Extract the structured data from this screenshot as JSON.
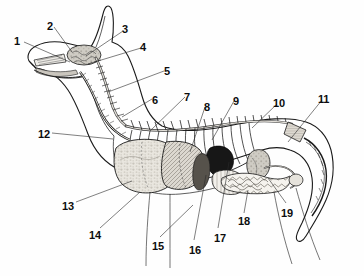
{
  "figure": {
    "view": "lateral (side) cutaway",
    "style": "pen-and-ink engraving, grayscale halftone",
    "background_color": "#fefefe",
    "ink_color": "#1a1a1a",
    "label_color": "#0d0d0d",
    "label_count": 19
  },
  "labels": [
    {
      "id": "1",
      "text": "1",
      "x": 14,
      "y": 36,
      "leader": [
        [
          24,
          42
        ],
        [
          70,
          62
        ]
      ]
    },
    {
      "id": "2",
      "text": "2",
      "x": 47,
      "y": 21,
      "leader": [
        [
          54,
          27
        ],
        [
          72,
          52
        ]
      ]
    },
    {
      "id": "3",
      "text": "3",
      "x": 122,
      "y": 24,
      "leader": [
        [
          123,
          31
        ],
        [
          86,
          56
        ]
      ]
    },
    {
      "id": "4",
      "text": "4",
      "x": 140,
      "y": 42,
      "leader": [
        [
          141,
          48
        ],
        [
          88,
          64
        ]
      ]
    },
    {
      "id": "5",
      "text": "5",
      "x": 164,
      "y": 66,
      "leader": [
        [
          164,
          71
        ],
        [
          108,
          92
        ]
      ]
    },
    {
      "id": "6",
      "text": "6",
      "x": 152,
      "y": 95,
      "leader": [
        [
          152,
          99
        ],
        [
          122,
          117
        ]
      ]
    },
    {
      "id": "7",
      "text": "7",
      "x": 184,
      "y": 92,
      "leader": [
        [
          185,
          97
        ],
        [
          150,
          131
        ]
      ]
    },
    {
      "id": "8",
      "text": "8",
      "x": 204,
      "y": 102,
      "leader": [
        [
          205,
          107
        ],
        [
          190,
          152
        ]
      ]
    },
    {
      "id": "9",
      "text": "9",
      "x": 233,
      "y": 96,
      "leader": [
        [
          234,
          101
        ],
        [
          212,
          140
        ]
      ]
    },
    {
      "id": "10",
      "text": "10",
      "x": 273,
      "y": 98,
      "leader": [
        [
          277,
          104
        ],
        [
          252,
          128
        ]
      ]
    },
    {
      "id": "11",
      "text": "11",
      "x": 318,
      "y": 94,
      "leader": [
        [
          322,
          100
        ],
        [
          288,
          142
        ]
      ]
    },
    {
      "id": "12",
      "text": "12",
      "x": 38,
      "y": 129,
      "leader": [
        [
          52,
          133
        ],
        [
          113,
          139
        ]
      ]
    },
    {
      "id": "13",
      "text": "13",
      "x": 62,
      "y": 201,
      "leader": [
        [
          76,
          202
        ],
        [
          132,
          181
        ]
      ]
    },
    {
      "id": "14",
      "text": "14",
      "x": 89,
      "y": 230,
      "leader": [
        [
          100,
          228
        ],
        [
          140,
          192
        ]
      ]
    },
    {
      "id": "15",
      "text": "15",
      "x": 152,
      "y": 241,
      "leader": [
        [
          160,
          237
        ],
        [
          193,
          205
        ]
      ]
    },
    {
      "id": "16",
      "text": "16",
      "x": 189,
      "y": 245,
      "leader": [
        [
          194,
          240
        ],
        [
          206,
          175
        ]
      ]
    },
    {
      "id": "17",
      "text": "17",
      "x": 214,
      "y": 233,
      "leader": [
        [
          218,
          228
        ],
        [
          229,
          162
        ]
      ]
    },
    {
      "id": "18",
      "text": "18",
      "x": 238,
      "y": 216,
      "leader": [
        [
          244,
          213
        ],
        [
          248,
          190
        ]
      ]
    },
    {
      "id": "19",
      "text": "19",
      "x": 281,
      "y": 208,
      "leader": [
        [
          286,
          203
        ],
        [
          268,
          178
        ]
      ]
    }
  ],
  "structures": {
    "skeleton": [
      "skull",
      "cervical vertebrae",
      "thoracic vertebrae",
      "lumbar vertebrae",
      "caudal vertebrae (tail)",
      "ribs",
      "sternum"
    ],
    "organs": [
      "brain",
      "nasal cavity",
      "tongue",
      "trachea",
      "lung",
      "heart",
      "liver",
      "stomach",
      "spleen",
      "kidney",
      "small intestine",
      "large intestine",
      "bladder"
    ]
  },
  "palette": {
    "lung_fill": "#e9e6df",
    "liver_fill": "#b9b5ac",
    "heart_fill": "#1c1c1c",
    "spleen_fill": "#6f6b64",
    "kidney_fill": "#9a968e",
    "intestine_fill": "#f3f1ec",
    "bone_fill": "#d8d5ce",
    "outline": "#1a1a1a"
  }
}
